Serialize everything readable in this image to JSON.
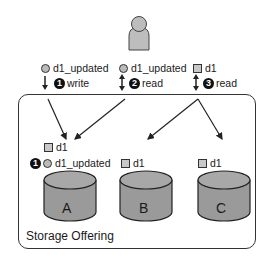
{
  "user": {
    "icon": "person-icon"
  },
  "operations": [
    {
      "step": "1",
      "action": "write",
      "arrow": "down",
      "data_marker": "circle",
      "data_label": "d1_updated"
    },
    {
      "step": "2",
      "action": "read",
      "arrow": "up-down",
      "data_marker": "circle",
      "data_label": "d1_updated"
    },
    {
      "step": "3",
      "action": "read",
      "arrow": "up-down",
      "data_marker": "square",
      "data_label": "d1"
    }
  ],
  "storage": {
    "label": "Storage Offering",
    "nodes": [
      {
        "name": "A",
        "items": [
          {
            "marker": "square",
            "label": "d1"
          },
          {
            "marker": "circle",
            "label": "d1_updated",
            "step": "1"
          }
        ]
      },
      {
        "name": "B",
        "items": [
          {
            "marker": "square",
            "label": "d1"
          }
        ]
      },
      {
        "name": "C",
        "items": [
          {
            "marker": "square",
            "label": "d1"
          }
        ]
      }
    ]
  },
  "colors": {
    "cylinder_fill": "#9a9a9a",
    "cylinder_top": "#a8a8a8",
    "stroke": "#222222",
    "person_fill": "#bdbdbd"
  }
}
